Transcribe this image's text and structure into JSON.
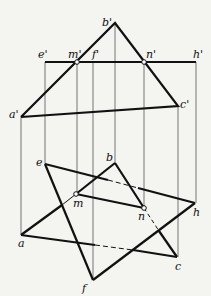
{
  "diagram": {
    "type": "descriptive-geometry-projection",
    "colors": {
      "background": "#f4f4f1",
      "line": "#111111",
      "projector": "#555555"
    },
    "front_view": {
      "points": {
        "a'": [
          21,
          117
        ],
        "b'": [
          115,
          23
        ],
        "c'": [
          178,
          106
        ],
        "e'": [
          45,
          62
        ],
        "f'": [
          93,
          62
        ],
        "h'": [
          196,
          62
        ],
        "m'": [
          77,
          62
        ],
        "n'": [
          144,
          62
        ]
      },
      "labels": [
        {
          "text": "b'",
          "x": 102,
          "y": 26
        },
        {
          "text": "e'",
          "x": 38,
          "y": 58
        },
        {
          "text": "m'",
          "x": 68,
          "y": 58
        },
        {
          "text": "f'",
          "x": 92,
          "y": 58
        },
        {
          "text": "n'",
          "x": 146,
          "y": 58
        },
        {
          "text": "h'",
          "x": 193,
          "y": 58
        },
        {
          "text": "c'",
          "x": 180,
          "y": 108
        },
        {
          "text": "a'",
          "x": 9,
          "y": 118
        }
      ]
    },
    "top_view": {
      "points": {
        "a": [
          21,
          235
        ],
        "b": [
          115,
          163
        ],
        "c": [
          177,
          257
        ],
        "e": [
          45,
          164
        ],
        "f": [
          93,
          280
        ],
        "h": [
          195,
          203
        ],
        "m": [
          76,
          194
        ],
        "n": [
          144,
          208
        ]
      },
      "labels": [
        {
          "text": "e",
          "x": 36,
          "y": 166
        },
        {
          "text": "b",
          "x": 106,
          "y": 161
        },
        {
          "text": "m",
          "x": 73,
          "y": 207
        },
        {
          "text": "n",
          "x": 138,
          "y": 220
        },
        {
          "text": "h",
          "x": 193,
          "y": 216
        },
        {
          "text": "a",
          "x": 18,
          "y": 247
        },
        {
          "text": "c",
          "x": 175,
          "y": 270
        },
        {
          "text": "f",
          "x": 82,
          "y": 292
        }
      ]
    }
  }
}
